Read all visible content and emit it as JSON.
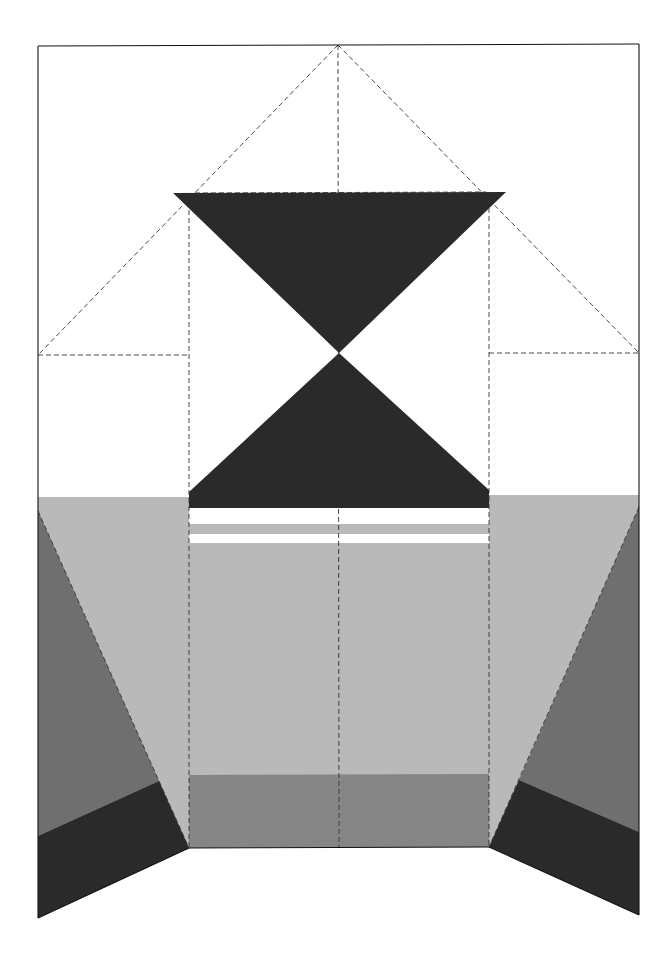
{
  "diagram": {
    "type": "fold-pattern",
    "colors": {
      "background": "#ffffff",
      "outline": "#111111",
      "dark": "#2a2a2a",
      "medium": "#6f6f6f",
      "light": "#b9b9b9",
      "mid_band": "#858585",
      "fold_line": "#333333"
    },
    "sheet": {
      "x": 38,
      "y": 45,
      "width": 601,
      "height": 0
    },
    "shapes": [
      {
        "name": "upper-dark-triangle",
        "fill": "dark",
        "points": "173,193 506,192 339,353"
      },
      {
        "name": "lower-dark-triangle",
        "fill": "dark",
        "points": "339,353 489,490 489,508 189,508 189,492"
      },
      {
        "name": "light-gray-band",
        "fill": "light",
        "points": "38,497 189,497 189,848 38,848"
      },
      {
        "name": "light-gray-band-right",
        "fill": "light",
        "points": "489,495 639,495 639,848 489,848"
      },
      {
        "name": "center-light-panel",
        "fill": "light",
        "points": "189,509 489,509 489,776 189,776"
      },
      {
        "name": "center-stripe-white-1",
        "fill": "white",
        "points": "189,509 489,509 489,524 189,524"
      },
      {
        "name": "center-stripe-white-2",
        "fill": "white",
        "points": "189,534 489,534 489,543 189,543"
      },
      {
        "name": "center-mid-band",
        "fill": "mid_band",
        "points": "189,775 489,774 489,847 189,848"
      },
      {
        "name": "left-medium-flap",
        "fill": "medium",
        "points": "38,511 159,781 38,836"
      },
      {
        "name": "left-dark-flap",
        "fill": "dark",
        "points": "38,836 159,781 189,848 38,918"
      },
      {
        "name": "right-medium-flap",
        "fill": "medium",
        "points": "639,507 519,780 639,832"
      },
      {
        "name": "right-dark-flap",
        "fill": "dark",
        "points": "519,780 639,832 639,915 489,847"
      }
    ],
    "solid_lines": [
      {
        "name": "sheet-top-edge",
        "d": "M38 46 L639 44"
      },
      {
        "name": "sheet-left-edge",
        "d": "M38 46 L38 918"
      },
      {
        "name": "sheet-right-edge",
        "d": "M639 44 L639 915"
      },
      {
        "name": "bottom-edge-left",
        "d": "M38 918 L189 848"
      },
      {
        "name": "bottom-edge-center",
        "d": "M189 848 L489 847"
      },
      {
        "name": "bottom-edge-right",
        "d": "M489 847 L639 915"
      }
    ],
    "dashed_lines": [
      {
        "name": "fold-center-vertical",
        "d": "M338 45 L339 848"
      },
      {
        "name": "fold-left-vertical",
        "d": "M189 210 L189 848"
      },
      {
        "name": "fold-right-vertical",
        "d": "M489 208 L489 847"
      },
      {
        "name": "fold-top-left-diagonal",
        "d": "M338 45 L38 355"
      },
      {
        "name": "fold-top-right-diagonal",
        "d": "M338 45 L639 353"
      },
      {
        "name": "fold-left-horizontal",
        "d": "M38 355 L189 355"
      },
      {
        "name": "fold-right-horizontal",
        "d": "M489 353 L639 353"
      },
      {
        "name": "fold-triangle-top",
        "d": "M195 193 L486 192"
      },
      {
        "name": "fold-left-lower-diagonal",
        "d": "M38 511 L189 848"
      },
      {
        "name": "fold-right-lower-diagonal",
        "d": "M639 507 L489 847"
      }
    ]
  }
}
